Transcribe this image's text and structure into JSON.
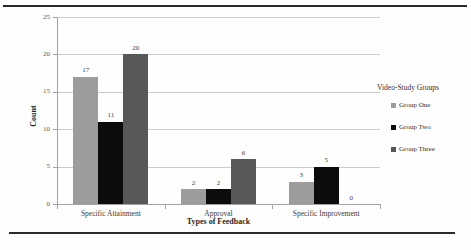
{
  "chart_data": {
    "type": "bar",
    "title": "",
    "categories": [
      "Specific Attainment",
      "Approval",
      "Specific Improvement"
    ],
    "series": [
      {
        "name": "Group One",
        "color": "#9c9c9c",
        "values": [
          17,
          2,
          3
        ]
      },
      {
        "name": "Group Two",
        "color": "#0c0c0c",
        "values": [
          11,
          2,
          5
        ]
      },
      {
        "name": "Group Three",
        "color": "#585858",
        "values": [
          20,
          6,
          0
        ]
      }
    ],
    "xlabel": "Types of Feedback",
    "ylabel": "Count",
    "ylim": [
      0,
      25
    ],
    "yticks": [
      0,
      5,
      10,
      15,
      20,
      25
    ],
    "grid": true,
    "bar_value_labels": true,
    "legend_title": "Video-Study Groups",
    "legend_position": "right",
    "colors": {
      "gridline": "#cccccc",
      "axis": "#a3a3a3",
      "frame_rule": "#2a2a2a",
      "background": "#fefefe"
    }
  }
}
